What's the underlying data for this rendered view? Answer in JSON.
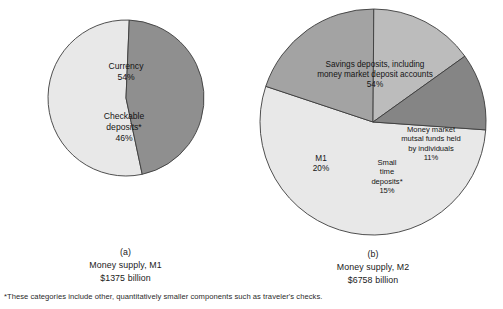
{
  "figure": {
    "background": "#ffffff",
    "footnote": "*These categories include other, quantitatively smaller components such as traveler's checks."
  },
  "chart_data": [
    {
      "id": "money-supply-m1",
      "type": "pie",
      "panel_letter": "(a)",
      "title": "Money supply, M1",
      "subtitle": "$1375 billion",
      "total_label": "$1375 billion",
      "categories": [
        "Currency",
        "Checkable deposits*"
      ],
      "values": [
        54,
        46
      ],
      "units": "percent",
      "start_angle_deg": 168,
      "direction": "clockwise",
      "radius_px": 78,
      "slices": [
        {
          "label": "Currency",
          "label_lines": [
            "Currency",
            "54%"
          ],
          "value": 54,
          "color": "#e8e8e8",
          "label_x": 0,
          "label_y": -26
        },
        {
          "label": "Checkable deposits*",
          "label_lines": [
            "Checkable",
            "deposits*",
            "46%"
          ],
          "value": 46,
          "color": "#8f8f8f",
          "label_x": -2,
          "label_y": 30
        }
      ]
    },
    {
      "id": "money-supply-m2",
      "type": "pie",
      "panel_letter": "(b)",
      "title": "Money supply, M2",
      "subtitle": "$6758 billion",
      "total_label": "$6758 billion",
      "categories": [
        "Savings deposits, including money market deposit accounts",
        "M1",
        "Small time deposits*",
        "Money market mutual funds held by individuals"
      ],
      "values": [
        54,
        20,
        15,
        11
      ],
      "units": "percent",
      "start_angle_deg": 94,
      "direction": "clockwise",
      "radius_px": 113,
      "slices": [
        {
          "label": "Savings deposits, including money market deposit accounts",
          "label_lines": [
            "Savings deposits, including",
            "money market deposit accounts",
            "54%"
          ],
          "value": 54,
          "color": "#e8e8e8",
          "label_x": 2,
          "label_y": -47
        },
        {
          "label": "M1",
          "label_lines": [
            "M1",
            "20%"
          ],
          "value": 20,
          "color": "#a3a3a3",
          "label_x": -52,
          "label_y": 42
        },
        {
          "label": "Small time deposits*",
          "label_lines": [
            "Small",
            "time",
            "deposits*",
            "15%"
          ],
          "value": 15,
          "color": "#bcbcbc",
          "label_x": 14,
          "label_y": 55
        },
        {
          "label": "Money market mutual funds held by individuals",
          "label_lines": [
            "Money market",
            "mutsal funds held",
            "by individuals",
            "11%"
          ],
          "value": 11,
          "color": "#858585",
          "label_x": 58,
          "label_y": 22
        }
      ]
    }
  ]
}
